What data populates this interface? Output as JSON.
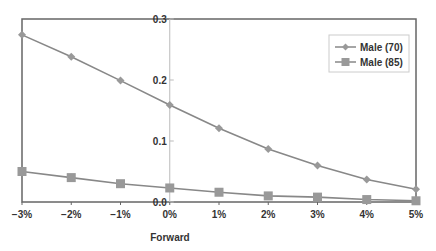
{
  "chart_data": {
    "type": "line",
    "title": "",
    "xlabel": "Forward",
    "ylabel": "",
    "categories": [
      "−3%",
      "−2%",
      "−1%",
      "0%",
      "1%",
      "2%",
      "3%",
      "4%",
      "5%"
    ],
    "series": [
      {
        "name": "Male (70)",
        "marker": "diamond",
        "values": [
          0.274,
          0.238,
          0.199,
          0.159,
          0.121,
          0.087,
          0.06,
          0.037,
          0.021
        ]
      },
      {
        "name": "Male (85)",
        "marker": "square",
        "values": [
          0.05,
          0.04,
          0.03,
          0.023,
          0.016,
          0.01,
          0.008,
          0.004,
          0.002
        ]
      }
    ],
    "yticks": [
      0.0,
      0.1,
      0.2,
      0.3
    ],
    "ytick_labels": [
      "0.0",
      "0.1",
      "0.2",
      "0.3"
    ],
    "ylim": [
      0.0,
      0.3
    ],
    "grid": false,
    "legend_position": "upper right",
    "y_axis_crosses_at_category": "0%"
  },
  "colors": {
    "series_line": "#888888",
    "axis": "#666666",
    "center_axis": "#bbbbbb",
    "text": "#333333",
    "legend_border": "#cccccc"
  }
}
